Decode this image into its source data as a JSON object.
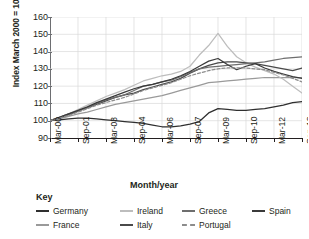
{
  "figure": {
    "title_cut_off": "",
    "xlabel": "Month/year",
    "ylabel": "Index March 2000 = 100",
    "legend_title": "Key"
  },
  "chart_data": {
    "type": "line",
    "title": "",
    "xlabel": "Month/year",
    "ylabel": "Index March 2000 = 100",
    "ylim": [
      90,
      160
    ],
    "yticks": [
      90,
      100,
      110,
      120,
      130,
      140,
      150,
      160
    ],
    "xticks": [
      "Mar-00",
      "Sep-01",
      "Mar-03",
      "Sep-04",
      "Mar-06",
      "Sep-07",
      "Mar-09",
      "Sep-10",
      "Mar-12",
      "Sep-13"
    ],
    "grid": true,
    "legend_position": "below",
    "x": [
      "Mar-00",
      "Sep-00",
      "Mar-01",
      "Sep-01",
      "Mar-02",
      "Sep-02",
      "Mar-03",
      "Sep-03",
      "Mar-04",
      "Sep-04",
      "Mar-05",
      "Sep-05",
      "Mar-06",
      "Sep-06",
      "Mar-07",
      "Sep-07",
      "Mar-08",
      "Sep-08",
      "Mar-09",
      "Sep-09",
      "Mar-10",
      "Sep-10",
      "Mar-11",
      "Sep-11",
      "Mar-12",
      "Sep-12",
      "Mar-13",
      "Sep-13"
    ],
    "series": [
      {
        "name": "Germany",
        "color": "#2f2f2f",
        "dash": false,
        "values": [
          100,
          100.5,
          101,
          101.5,
          101.5,
          101,
          100.5,
          100,
          99.5,
          99,
          98.5,
          97.5,
          96.5,
          96.5,
          97,
          98,
          99.5,
          104.5,
          107,
          106.5,
          106,
          106,
          106.5,
          107,
          108,
          109,
          110.5,
          111
        ]
      },
      {
        "name": "France",
        "color": "#9a9a9a",
        "dash": false,
        "values": [
          100,
          101,
          102.5,
          104,
          105,
          106.5,
          108,
          109.5,
          110.5,
          111.5,
          112.5,
          113.5,
          114.5,
          116,
          117.5,
          119,
          120.5,
          122,
          122.5,
          123,
          123.5,
          124,
          124.5,
          125,
          125,
          125,
          125,
          125
        ]
      },
      {
        "name": "Ireland",
        "color": "#bdbdbd",
        "dash": false,
        "values": [
          100,
          102,
          104,
          106.5,
          109,
          111.5,
          114,
          116,
          118,
          120.5,
          123,
          124.5,
          126,
          127,
          128.5,
          131.5,
          138,
          143.5,
          150.5,
          143,
          137,
          133.5,
          131,
          129,
          127,
          124,
          120,
          116
        ]
      },
      {
        "name": "Italy",
        "color": "#4a4a4a",
        "dash": false,
        "values": [
          100,
          101.5,
          103.5,
          105.5,
          107.5,
          109.5,
          111.5,
          113.5,
          115,
          116,
          118,
          119.5,
          121,
          122.5,
          124.5,
          127.5,
          130,
          132,
          133.5,
          134,
          134,
          133.5,
          133,
          132,
          131,
          130,
          129,
          130.5
        ]
      },
      {
        "name": "Greece",
        "color": "#6e6e6e",
        "dash": false,
        "values": [
          100,
          102,
          104,
          105.5,
          107.5,
          110,
          112,
          113.5,
          115,
          117.5,
          120,
          121,
          122.5,
          123.5,
          125.5,
          128,
          130,
          131,
          131.5,
          132,
          132.5,
          133,
          133.5,
          134,
          135,
          136,
          136.5,
          137
        ]
      },
      {
        "name": "Spain",
        "color": "#3a3a3a",
        "dash": false,
        "values": [
          100,
          102,
          104,
          106,
          108,
          110.5,
          112.5,
          114.5,
          116.5,
          118.5,
          120,
          121,
          122.5,
          124,
          126,
          128.5,
          131.5,
          134.5,
          136,
          132.5,
          129.5,
          131.5,
          133,
          130.5,
          128.5,
          127,
          125.5,
          124.5
        ]
      },
      {
        "name": "Portugal",
        "color": "#8c8c8c",
        "dash": true,
        "values": [
          100,
          101.5,
          103,
          105,
          107,
          109,
          110.5,
          112,
          113.5,
          115.5,
          117.5,
          119,
          120.5,
          122,
          124,
          126,
          127.5,
          129,
          130,
          130.5,
          130.5,
          130.5,
          130,
          129.5,
          128,
          126.5,
          124.5,
          122.5
        ]
      }
    ]
  }
}
